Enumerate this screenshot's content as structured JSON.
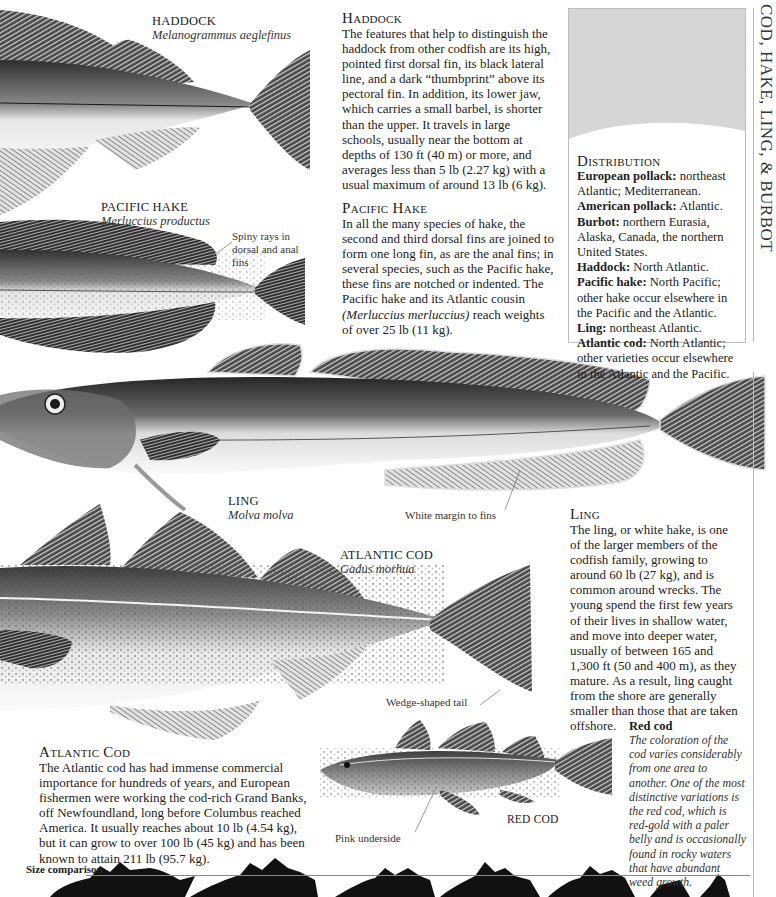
{
  "page_title_vertical": "COD, HAKE, LING, & BURBOT",
  "fish_labels": {
    "haddock": {
      "name": "HADDOCK",
      "latin": "Melanogrammus aeglefinus"
    },
    "pacific_hake": {
      "name": "PACIFIC HAKE",
      "latin": "Merluccius productus"
    },
    "ling": {
      "name": "LING",
      "latin": "Molva molva"
    },
    "atlantic_cod": {
      "name": "ATLANTIC COD",
      "latin": "Gadus morhua"
    },
    "red_cod": {
      "name": "RED COD"
    }
  },
  "callouts": {
    "spiny_rays": "Spiny rays in dorsal and anal fins",
    "white_margin": "White margin to fins",
    "wedge_tail": "Wedge-shaped tail",
    "pink_underside": "Pink underside"
  },
  "sections": {
    "haddock": {
      "heading": "Haddock",
      "text": "The features that help to distinguish the haddock from other codfish are its high, pointed first dorsal fin, its black lateral line, and a dark “thumbprint” above its pectoral fin. In addition, its lower jaw, which carries a small barbel, is shorter than the upper. It travels in large schools, usually near the bottom at depths of 130 ft (40 m) or more, and averages less than 5 lb (2.27 kg) with a usual maximum of around 13 lb (6 kg)."
    },
    "pacific_hake": {
      "heading": "Pacific Hake",
      "text_before": "In all the many species of hake, the second and third dorsal fins are joined to form one long fin, as are the anal fins; in several species, such as the Pacific hake, these fins are notched or indented. The Pacific hake and its Atlantic cousin ",
      "text_italic": "(Merluccius merluccius)",
      "text_after": " reach weights of over 25 lb (11 kg)."
    },
    "ling": {
      "heading": "Ling",
      "text": "The ling, or white hake, is one of the larger members of the codfish family, growing to around 60 lb (27 kg), and is common around wrecks. The young spend the first few years of their lives in shallow water, and move into deeper water, usually of between 165 and 1,300 ft (50 and 400 m), as they mature. As a result, ling caught from the shore are generally smaller than those that are taken offshore."
    },
    "atlantic_cod": {
      "heading": "Atlantic Cod",
      "text": "The Atlantic cod has had immense commercial importance for hundreds of years, and European fishermen were working the cod-rich Grand Banks, off Newfoundland, long before Columbus reached America. It usually reaches about 10 lb (4.54 kg), but it can grow to over 100 lb (45 kg) and has been known to attain 211 lb (95.7 kg)."
    },
    "red_cod": {
      "heading": "Red cod",
      "text": "The coloration of the cod varies considerably from one area to another. One of the most distinctive variations is the red cod, which is red-gold with a paler belly and is occasionally found in rocky waters that have abundant weed growth."
    }
  },
  "distribution": {
    "heading": "Distribution",
    "entries": [
      {
        "species": "European pollack:",
        "range": " northeast Atlantic; Mediterranean."
      },
      {
        "species": "American pollack:",
        "range": " Atlantic."
      },
      {
        "species": "Burbot:",
        "range": " northern Eurasia, Alaska, Canada, the northern United States."
      },
      {
        "species": "Haddock:",
        "range": " North Atlantic."
      },
      {
        "species": "Pacific hake:",
        "range": " North Pacific; other hake occur elsewhere in the Pacific and the Atlantic."
      },
      {
        "species": "Ling:",
        "range": " northeast Atlantic."
      },
      {
        "species": "Atlantic cod:",
        "range": " North Atlantic; other varieties occur elsewhere in the Atlantic and the Pacific."
      }
    ]
  },
  "size_comparison": {
    "label": "Size comparison"
  },
  "colors": {
    "fin_dark": "#2e2e2e",
    "body_mid": "#7a7a7a",
    "belly": "#f2f2f2",
    "map_water": "#d6d6d6",
    "map_land": "#ffffff",
    "rule": "#b8b8b8"
  }
}
